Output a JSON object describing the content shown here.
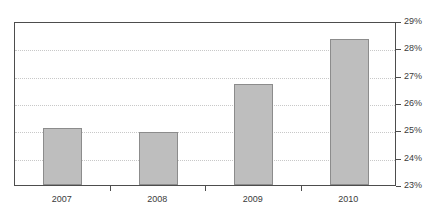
{
  "chart_data": {
    "type": "bar",
    "title": "",
    "subtitle": "",
    "xlabel": "",
    "ylabel": "",
    "categories": [
      "2007",
      "2008",
      "2009",
      "2010"
    ],
    "values": [
      25.1,
      24.95,
      26.7,
      28.35
    ],
    "value_suffix": "%",
    "ylim": [
      23,
      29
    ],
    "ytick_step": 1,
    "ytick_labels": [
      "23%",
      "24%",
      "25%",
      "26%",
      "27%",
      "28%",
      "29%"
    ],
    "ytick_values": [
      23,
      24,
      25,
      26,
      27,
      28,
      29
    ],
    "y_axis_position": "right",
    "grid": true,
    "grid_style": "dotted",
    "legend": false,
    "series": [
      {
        "name": "",
        "values": [
          25.1,
          24.95,
          26.7,
          28.35
        ]
      }
    ]
  },
  "style": {
    "bar_fill": "#bebebe",
    "bar_stroke": "#8c8c8c",
    "grid_color": "#c8c8c8",
    "axis_color": "#4d4d4d",
    "text_color": "#3b3b3b",
    "background": "#ffffff"
  }
}
